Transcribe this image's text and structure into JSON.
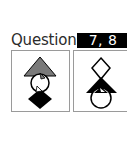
{
  "heading": {
    "label": "Questions",
    "badge": "7, 8"
  },
  "panels": [
    {
      "id": "panel-1",
      "shapes": [
        {
          "type": "triangle",
          "fill": "#7a7a7a",
          "position": "top"
        },
        {
          "type": "circle",
          "fill": "#ffffff",
          "stroke": "#000000",
          "position": "middle"
        },
        {
          "type": "diamond",
          "fill": "#000000",
          "position": "bottom"
        }
      ]
    },
    {
      "id": "panel-2",
      "shapes": [
        {
          "type": "diamond",
          "fill": "#ffffff",
          "stroke": "#000000",
          "position": "top"
        },
        {
          "type": "triangle",
          "fill": "#000000",
          "position": "middle"
        },
        {
          "type": "circle",
          "fill": "#ffffff",
          "stroke": "#000000",
          "position": "bottom"
        }
      ]
    }
  ],
  "colors": {
    "badge_bg": "#000000",
    "badge_text": "#ffffff",
    "heading_text": "#2b2b2b",
    "panel_border": "#9a9a9a",
    "gray_shape": "#7a7a7a"
  }
}
